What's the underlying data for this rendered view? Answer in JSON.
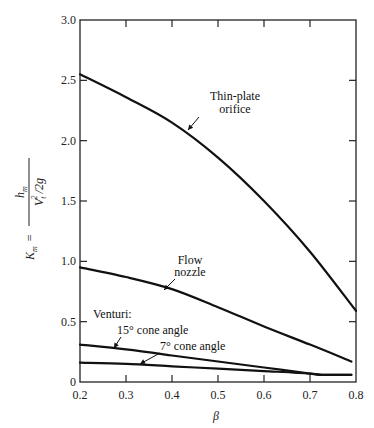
{
  "chart_data": {
    "type": "line",
    "title": "",
    "xlabel": "β",
    "ylabel": "K_m = h_m / (V_t² / 2g)",
    "ylabel_parts": {
      "lhs": "K",
      "lhs_sub": "m",
      "eq": "=",
      "num": "h",
      "num_sub": "m",
      "den": "V",
      "den_sub": "t",
      "den_sup": "2",
      "den_tail": "/2g"
    },
    "xlim": [
      0.2,
      0.8
    ],
    "ylim": [
      0,
      3.0
    ],
    "x_ticks": [
      "0.2",
      "0.3",
      "0.4",
      "0.5",
      "0.6",
      "0.7",
      "0.8"
    ],
    "y_ticks": [
      "0",
      "0.5",
      "1.0",
      "1.5",
      "2.0",
      "2.5",
      "3.0"
    ],
    "grid": false,
    "legend": "none (inline annotations)",
    "series": [
      {
        "name": "Thin-plate orifice",
        "label_lines": [
          "Thin-plate",
          "orifice"
        ],
        "x": [
          0.2,
          0.3,
          0.4,
          0.5,
          0.6,
          0.7,
          0.8
        ],
        "y": [
          2.55,
          2.36,
          2.15,
          1.86,
          1.5,
          1.08,
          0.59
        ]
      },
      {
        "name": "Flow nozzle",
        "label_lines": [
          "Flow",
          "nozzle"
        ],
        "x": [
          0.2,
          0.3,
          0.4,
          0.5,
          0.6,
          0.7,
          0.79
        ],
        "y": [
          0.95,
          0.87,
          0.77,
          0.62,
          0.46,
          0.31,
          0.17
        ]
      },
      {
        "name": "Venturi: 15° cone angle",
        "label_lines": [
          "15° cone angle"
        ],
        "x": [
          0.2,
          0.3,
          0.4,
          0.5,
          0.6,
          0.7,
          0.73,
          0.79
        ],
        "y": [
          0.31,
          0.27,
          0.22,
          0.17,
          0.12,
          0.07,
          0.06,
          0.06
        ]
      },
      {
        "name": "Venturi: 7° cone angle",
        "label_lines": [
          "7° cone angle"
        ],
        "x": [
          0.2,
          0.3,
          0.4,
          0.5,
          0.6,
          0.7,
          0.72,
          0.79
        ],
        "y": [
          0.16,
          0.15,
          0.13,
          0.11,
          0.09,
          0.07,
          0.06,
          0.06
        ]
      }
    ],
    "annotations": [
      {
        "text": "Venturi:",
        "x": 0.222,
        "y": 0.52
      }
    ]
  }
}
